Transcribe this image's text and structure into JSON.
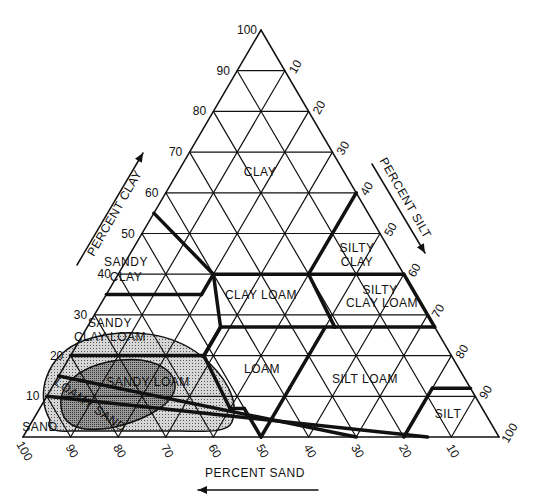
{
  "diagram": {
    "type": "soil-texture-triangle",
    "axes": {
      "clay": {
        "label": "PERCENT CLAY",
        "ticks": [
          "10",
          "20",
          "30",
          "40",
          "50",
          "60",
          "70",
          "80",
          "90",
          "100"
        ]
      },
      "silt": {
        "label": "PERCENT SILT",
        "ticks": [
          "10",
          "20",
          "30",
          "40",
          "50",
          "60",
          "70",
          "80",
          "90",
          "100"
        ]
      },
      "sand": {
        "label": "PERCENT SAND",
        "ticks": [
          "100",
          "90",
          "80",
          "70",
          "60",
          "50",
          "40",
          "30",
          "20",
          "10"
        ]
      }
    },
    "regions": [
      {
        "name": "clay",
        "lines": [
          "CLAY"
        ]
      },
      {
        "name": "sandy-clay",
        "lines": [
          "SANDY",
          "CLAY"
        ]
      },
      {
        "name": "silty-clay",
        "lines": [
          "SILTY",
          "CLAY"
        ]
      },
      {
        "name": "clay-loam",
        "lines": [
          "CLAY LOAM"
        ]
      },
      {
        "name": "silty-clay-loam",
        "lines": [
          "SILTY",
          "CLAY LOAM"
        ]
      },
      {
        "name": "sandy-clay-loam",
        "lines": [
          "SANDY",
          "CLAY LOAM"
        ]
      },
      {
        "name": "loam",
        "lines": [
          "LOAM"
        ]
      },
      {
        "name": "silt-loam",
        "lines": [
          "SILT LOAM"
        ]
      },
      {
        "name": "sandy-loam",
        "lines": [
          "SANDY LOAM"
        ]
      },
      {
        "name": "silt",
        "lines": [
          "SILT"
        ]
      },
      {
        "name": "loamy-sand",
        "lines": [
          "LOAMY SAND"
        ]
      },
      {
        "name": "sand",
        "lines": [
          "SAND"
        ]
      }
    ],
    "colors": {
      "line": "#111111",
      "shade_outer": "#bdbdbd",
      "shade_inner": "#8a8a8a"
    }
  }
}
